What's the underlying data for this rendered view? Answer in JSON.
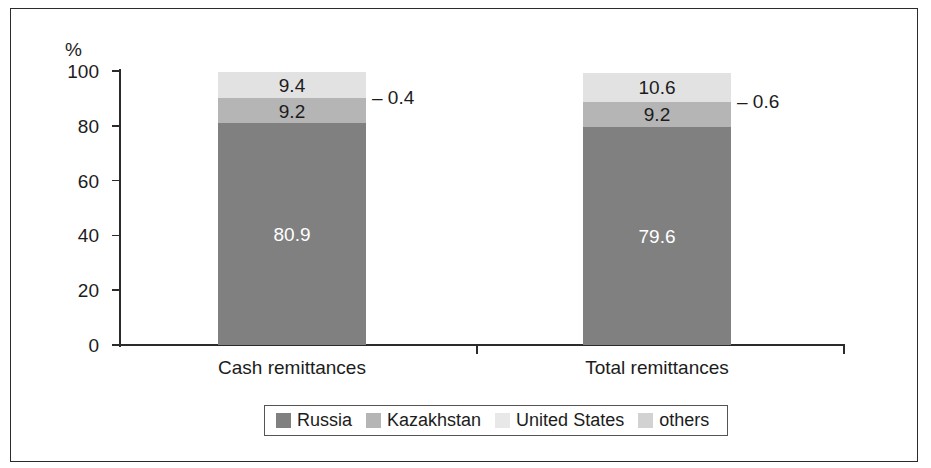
{
  "figure": {
    "y_axis_title": "%"
  },
  "chart_data": {
    "type": "bar",
    "title": "",
    "subtitle": "",
    "xlabel": "",
    "ylabel": "%",
    "ylim": [
      0,
      100
    ],
    "yticks": [
      "0",
      "20",
      "40",
      "60",
      "80",
      "100"
    ],
    "grid": false,
    "stacked": true,
    "stack_orientation": "vertical",
    "legend_position": "bottom",
    "categories": [
      "Cash remittances",
      "Total remittances"
    ],
    "series": [
      {
        "name": "Russia",
        "color": "#808080",
        "values": [
          80.9,
          79.6
        ]
      },
      {
        "name": "Kazakhstan",
        "color": "#b5b5b5",
        "values": [
          9.2,
          9.2
        ]
      },
      {
        "name": "United States",
        "color": "#e2e2e2",
        "values": [
          9.4,
          10.6
        ]
      },
      {
        "name": "others",
        "color": "#cfcfcf",
        "values": [
          0.4,
          0.6
        ]
      }
    ],
    "annotations": [
      {
        "text": "0.4",
        "prefix": "–",
        "series": "others",
        "category": "Cash remittances"
      },
      {
        "text": "0.6",
        "prefix": "–",
        "series": "others",
        "category": "Total remittances"
      }
    ],
    "data_labels": {
      "Cash remittances": {
        "Russia": "80.9",
        "Kazakhstan": "9.2",
        "United States": "9.4",
        "others": "0.4"
      },
      "Total remittances": {
        "Russia": "79.6",
        "Kazakhstan": "9.2",
        "United States": "10.6",
        "others": "0.6"
      }
    }
  },
  "legend": {
    "items": [
      {
        "label": "Russia",
        "color": "#808080"
      },
      {
        "label": "Kazakhstan",
        "color": "#b5b5b5"
      },
      {
        "label": "United States",
        "color": "#e8e8e8"
      },
      {
        "label": "others",
        "color": "#d2d2d2"
      }
    ]
  }
}
